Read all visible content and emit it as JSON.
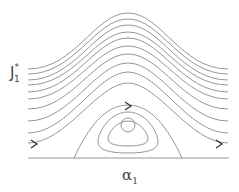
{
  "diagram": {
    "type": "phase-portrait",
    "y_axis_label": {
      "main": "J",
      "sub": "1",
      "sup": "*"
    },
    "x_axis_label": {
      "main": "α",
      "sub": "1"
    },
    "colors": {
      "curves": "#8a8a8a",
      "arrows": "#333333",
      "text": "#444444"
    },
    "open_trajectories": 11,
    "closed_orbits": 3,
    "arrows": [
      "left-bottom-trajectory",
      "separatrix-top",
      "right-bottom-trajectory"
    ]
  }
}
